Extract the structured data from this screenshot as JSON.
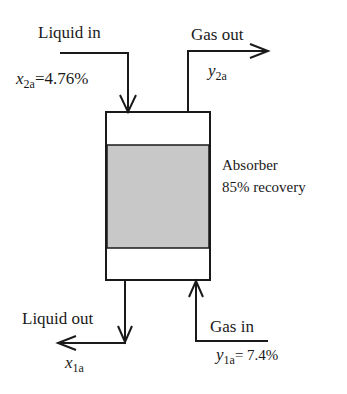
{
  "diagram": {
    "type": "absorber-flow-diagram",
    "unit": {
      "name": "Absorber",
      "spec": "85% recovery",
      "fill_color": "#c8c8c8",
      "stroke_color": "#1a1a1a"
    },
    "streams": {
      "liquid_in": {
        "label": "Liquid in",
        "var": "x",
        "sub": "2a",
        "value": "=4.76%"
      },
      "gas_out": {
        "label": "Gas out",
        "var": "y",
        "sub": "2a",
        "value": ""
      },
      "liquid_out": {
        "label": "Liquid out",
        "var": "x",
        "sub": "1a",
        "value": ""
      },
      "gas_in": {
        "label": "Gas in",
        "var": "y",
        "sub": "1a",
        "value": "= 7.4%"
      }
    }
  }
}
